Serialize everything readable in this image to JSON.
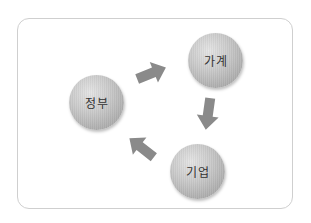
{
  "diagram": {
    "type": "circular-flow",
    "nodes": [
      {
        "id": "household",
        "label": "가계"
      },
      {
        "id": "government",
        "label": "정부"
      },
      {
        "id": "firm",
        "label": "기업"
      }
    ],
    "edges": [
      {
        "from": "government",
        "to": "household"
      },
      {
        "from": "household",
        "to": "firm"
      },
      {
        "from": "firm",
        "to": "government"
      }
    ],
    "colors": {
      "arrow": "#8a8a8a",
      "node": "#bdbdbd",
      "frame_border": "#cfcfcf",
      "label": "#333333"
    }
  }
}
